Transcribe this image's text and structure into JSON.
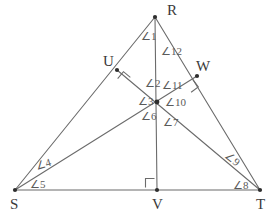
{
  "figure": {
    "type": "geometry-diagram",
    "shape": "triangle-with-cevians",
    "background_color": "#ffffff",
    "line_color": "#6b6b6b",
    "label_color": "#5a5a5a",
    "vertex_label_color": "#3a3a3a"
  },
  "vertices": [
    {
      "id": "R",
      "label": "R",
      "x": 155,
      "y": 17,
      "label_x": 167,
      "label_y": 15,
      "dot": true
    },
    {
      "id": "S",
      "label": "S",
      "x": 15,
      "y": 190,
      "label_x": 10,
      "label_y": 209,
      "dot": true
    },
    {
      "id": "T",
      "label": "T",
      "x": 260,
      "y": 190,
      "label_x": 256,
      "label_y": 209,
      "dot": true
    },
    {
      "id": "U",
      "label": "U",
      "x": 117,
      "y": 70,
      "label_x": 103,
      "label_y": 66,
      "dot": true
    },
    {
      "id": "V",
      "label": "V",
      "x": 157,
      "y": 190,
      "label_x": 152,
      "label_y": 209,
      "dot": true
    },
    {
      "id": "W",
      "label": "W",
      "x": 197,
      "y": 76,
      "label_x": 196,
      "label_y": 71,
      "dot": true
    }
  ],
  "segments": [
    {
      "name": "side-RS",
      "x1": 155,
      "y1": 17,
      "x2": 15,
      "y2": 190
    },
    {
      "name": "side-RT",
      "x1": 155,
      "y1": 17,
      "x2": 260,
      "y2": 190
    },
    {
      "name": "side-ST",
      "x1": 15,
      "y1": 190,
      "x2": 260,
      "y2": 190
    },
    {
      "name": "cevian-RV",
      "x1": 155,
      "y1": 17,
      "x2": 157,
      "y2": 190
    },
    {
      "name": "cevian-SW",
      "x1": 15,
      "y1": 190,
      "x2": 197,
      "y2": 76
    },
    {
      "name": "cevian-TU",
      "x1": 260,
      "y1": 190,
      "x2": 117,
      "y2": 70
    }
  ],
  "intersection_point": {
    "name": "orthocenter",
    "x": 157,
    "y": 102,
    "dot": true
  },
  "right_angle_marks": [
    {
      "name": "right-angle-at-U",
      "cx": 124,
      "cy": 78,
      "rotation": 40
    },
    {
      "name": "right-angle-at-W",
      "cx": 192,
      "cy": 86,
      "rotation": 143
    },
    {
      "name": "right-angle-at-V",
      "cx": 150,
      "cy": 183,
      "rotation": 0
    }
  ],
  "angle_labels": [
    {
      "id": "1",
      "text": "∠1",
      "x": 141,
      "y": 40,
      "rotation": 0
    },
    {
      "id": "2",
      "text": "∠2",
      "x": 145,
      "y": 87,
      "rotation": 0
    },
    {
      "id": "3",
      "text": "∠3",
      "x": 138,
      "y": 105,
      "rotation": 0
    },
    {
      "id": "4",
      "text": "∠4",
      "x": 37,
      "y": 170,
      "rotation": -17
    },
    {
      "id": "5",
      "text": "∠5",
      "x": 30,
      "y": 188,
      "rotation": 0
    },
    {
      "id": "6",
      "text": "∠6",
      "x": 141,
      "y": 120,
      "rotation": 0
    },
    {
      "id": "7",
      "text": "∠7",
      "x": 163,
      "y": 126,
      "rotation": 0
    },
    {
      "id": "8",
      "text": "∠8",
      "x": 233,
      "y": 189,
      "rotation": 0
    },
    {
      "id": "9",
      "text": "∠9",
      "x": 224,
      "y": 157,
      "rotation": 38
    },
    {
      "id": "10",
      "text": "∠10",
      "x": 165,
      "y": 106,
      "rotation": 0
    },
    {
      "id": "11",
      "text": "∠11",
      "x": 162,
      "y": 89,
      "rotation": 0
    },
    {
      "id": "12",
      "text": "∠12",
      "x": 161,
      "y": 55,
      "rotation": 0
    }
  ]
}
